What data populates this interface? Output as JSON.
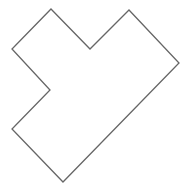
{
  "diagram": {
    "shape": "polygon",
    "stroke_color": "#666666",
    "fill_color": "#ffffff",
    "stroke_width": 1.3,
    "vertices": [
      [
        51,
        9
      ],
      [
        90,
        49
      ],
      [
        129,
        10
      ],
      [
        179,
        63
      ],
      [
        63,
        182
      ],
      [
        12,
        129
      ],
      [
        50,
        90
      ],
      [
        12,
        49
      ]
    ]
  }
}
